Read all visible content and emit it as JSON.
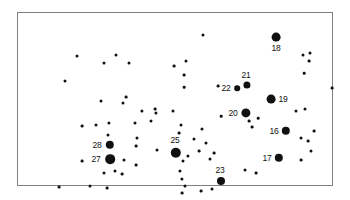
{
  "figure": {
    "title": "",
    "background_color": "#ffffff",
    "frame_color": "#808080",
    "point_color": "#111111"
  },
  "chart_data": {
    "type": "scatter",
    "title": "",
    "subtitle": "",
    "xlabel": "",
    "ylabel": "",
    "xlim": [
      0,
      316
    ],
    "ylim": [
      0,
      174
    ],
    "grid": false,
    "legend": false,
    "axes_visible": false,
    "frame": {
      "x": 17,
      "y": 12,
      "width": 316,
      "height": 174
    },
    "series": [
      {
        "name": "labelled-sites",
        "marker": "filled-circle",
        "color": "#111111",
        "points": [
          {
            "label": "16",
            "x": 268,
            "y": 118,
            "r": 4.2,
            "label_dx": -12,
            "label_dy": 0
          },
          {
            "label": "17",
            "x": 261,
            "y": 145,
            "r": 4.2,
            "label_dx": -12,
            "label_dy": 0
          },
          {
            "label": "18",
            "x": 258,
            "y": 24,
            "r": 4.4,
            "label_dx": 0,
            "label_dy": 11
          },
          {
            "label": "19",
            "x": 253,
            "y": 86,
            "r": 4.4,
            "label_dx": 12,
            "label_dy": 0
          },
          {
            "label": "20",
            "x": 228,
            "y": 100,
            "r": 4.6,
            "label_dx": -13,
            "label_dy": 0
          },
          {
            "label": "21",
            "x": 229,
            "y": 72,
            "r": 3.6,
            "label_dx": -1,
            "label_dy": -10
          },
          {
            "label": "22",
            "x": 219,
            "y": 75,
            "r": 2.8,
            "label_dx": -11,
            "label_dy": 0
          },
          {
            "label": "23",
            "x": 203,
            "y": 168,
            "r": 4.0,
            "label_dx": -1,
            "label_dy": -11
          },
          {
            "label": "25",
            "x": 158,
            "y": 140,
            "r": 5.2,
            "label_dx": -1,
            "label_dy": -13
          },
          {
            "label": "27",
            "x": 92,
            "y": 146,
            "r": 4.8,
            "label_dx": -14,
            "label_dy": 0
          },
          {
            "label": "28",
            "x": 92,
            "y": 132,
            "r": 4.2,
            "label_dx": -13,
            "label_dy": 0
          }
        ]
      },
      {
        "name": "background-points",
        "marker": "filled-circle",
        "color": "#111111",
        "points": [
          {
            "x": 59,
            "y": 43,
            "r": 1.5
          },
          {
            "x": 86,
            "y": 50,
            "r": 1.5
          },
          {
            "x": 98,
            "y": 42,
            "r": 1.5
          },
          {
            "x": 111,
            "y": 50,
            "r": 1.5
          },
          {
            "x": 47,
            "y": 68,
            "r": 1.5
          },
          {
            "x": 185,
            "y": 22,
            "r": 1.5
          },
          {
            "x": 168,
            "y": 48,
            "r": 1.5
          },
          {
            "x": 166,
            "y": 62,
            "r": 1.4
          },
          {
            "x": 200,
            "y": 73,
            "r": 1.4
          },
          {
            "x": 166,
            "y": 74,
            "r": 1.3
          },
          {
            "x": 285,
            "y": 42,
            "r": 1.5
          },
          {
            "x": 292,
            "y": 40,
            "r": 1.5
          },
          {
            "x": 291,
            "y": 48,
            "r": 1.4
          },
          {
            "x": 286,
            "y": 60,
            "r": 1.3
          },
          {
            "x": 314,
            "y": 75,
            "r": 1.4
          },
          {
            "x": 83,
            "y": 88,
            "r": 1.5
          },
          {
            "x": 105,
            "y": 90,
            "r": 1.5
          },
          {
            "x": 108,
            "y": 84,
            "r": 1.4
          },
          {
            "x": 124,
            "y": 98,
            "r": 1.6
          },
          {
            "x": 138,
            "y": 100,
            "r": 1.6
          },
          {
            "x": 155,
            "y": 98,
            "r": 1.5
          },
          {
            "x": 117,
            "y": 110,
            "r": 1.5
          },
          {
            "x": 91,
            "y": 110,
            "r": 1.6
          },
          {
            "x": 78,
            "y": 112,
            "r": 1.5
          },
          {
            "x": 64,
            "y": 113,
            "r": 1.4
          },
          {
            "x": 133,
            "y": 108,
            "r": 1.5
          },
          {
            "x": 90,
            "y": 122,
            "r": 1.5
          },
          {
            "x": 119,
            "y": 125,
            "r": 1.5
          },
          {
            "x": 163,
            "y": 112,
            "r": 1.5
          },
          {
            "x": 161,
            "y": 120,
            "r": 1.4
          },
          {
            "x": 118,
            "y": 133,
            "r": 1.4
          },
          {
            "x": 139,
            "y": 137,
            "r": 1.5
          },
          {
            "x": 106,
            "y": 147,
            "r": 1.5
          },
          {
            "x": 64,
            "y": 148,
            "r": 1.4
          },
          {
            "x": 97,
            "y": 158,
            "r": 1.5
          },
          {
            "x": 104,
            "y": 161,
            "r": 1.4
          },
          {
            "x": 86,
            "y": 160,
            "r": 1.5
          },
          {
            "x": 72,
            "y": 173,
            "r": 1.5
          },
          {
            "x": 89,
            "y": 175,
            "r": 1.4
          },
          {
            "x": 41,
            "y": 174,
            "r": 1.4
          },
          {
            "x": 118,
            "y": 152,
            "r": 1.4
          },
          {
            "x": 165,
            "y": 148,
            "r": 1.5
          },
          {
            "x": 170,
            "y": 143,
            "r": 1.6
          },
          {
            "x": 162,
            "y": 158,
            "r": 1.6
          },
          {
            "x": 164,
            "y": 166,
            "r": 1.6
          },
          {
            "x": 167,
            "y": 173,
            "r": 1.5
          },
          {
            "x": 164,
            "y": 180,
            "r": 1.4
          },
          {
            "x": 192,
            "y": 146,
            "r": 1.5
          },
          {
            "x": 194,
            "y": 176,
            "r": 1.5
          },
          {
            "x": 183,
            "y": 178,
            "r": 1.4
          },
          {
            "x": 176,
            "y": 126,
            "r": 1.5
          },
          {
            "x": 184,
            "y": 116,
            "r": 1.5
          },
          {
            "x": 188,
            "y": 130,
            "r": 1.5
          },
          {
            "x": 181,
            "y": 138,
            "r": 1.4
          },
          {
            "x": 196,
            "y": 140,
            "r": 1.4
          },
          {
            "x": 227,
            "y": 157,
            "r": 1.5
          },
          {
            "x": 238,
            "y": 160,
            "r": 1.4
          },
          {
            "x": 231,
            "y": 108,
            "r": 1.4
          },
          {
            "x": 234,
            "y": 114,
            "r": 1.4
          },
          {
            "x": 240,
            "y": 105,
            "r": 1.3
          },
          {
            "x": 278,
            "y": 98,
            "r": 1.5
          },
          {
            "x": 287,
            "y": 96,
            "r": 1.5
          },
          {
            "x": 283,
            "y": 125,
            "r": 1.5
          },
          {
            "x": 290,
            "y": 128,
            "r": 1.4
          },
          {
            "x": 296,
            "y": 118,
            "r": 1.4
          },
          {
            "x": 293,
            "y": 138,
            "r": 1.5
          },
          {
            "x": 283,
            "y": 147,
            "r": 1.4
          },
          {
            "x": 156,
            "y": 53,
            "r": 1.4
          },
          {
            "x": 137,
            "y": 96,
            "r": 1.4
          },
          {
            "x": 203,
            "y": 103,
            "r": 1.3
          }
        ]
      }
    ]
  }
}
